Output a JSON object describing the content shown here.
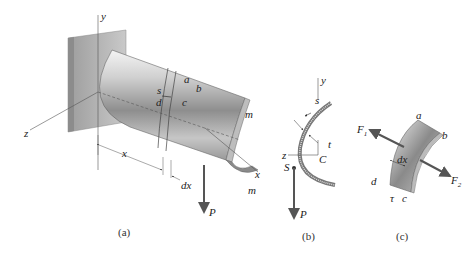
{
  "figure": {
    "panel_a": {
      "caption": "(a)",
      "labels": {
        "y": "y",
        "z": "z",
        "x_axis": "x",
        "x_dim": "x",
        "dx": "dx",
        "s": "s",
        "a": "a",
        "b": "b",
        "c": "c",
        "d": "d",
        "m_top": "m",
        "m_bottom": "m",
        "P": "P"
      }
    },
    "panel_b": {
      "caption": "(b)",
      "labels": {
        "y": "y",
        "z": "z",
        "s": "s",
        "t": "t",
        "C": "C",
        "S": "S",
        "P": "P"
      }
    },
    "panel_c": {
      "caption": "(c)",
      "labels": {
        "F1": "F",
        "F1_sub": "1",
        "F2": "F",
        "F2_sub": "2",
        "a": "a",
        "b": "b",
        "c": "c",
        "d": "d",
        "dx": "dx",
        "tau": "τ"
      }
    },
    "colors": {
      "metal_light": "#e6e6e6",
      "metal_mid": "#a8a8a8",
      "metal_dark": "#707070",
      "wall": "#b5b5b5",
      "arrow": "#555555"
    }
  }
}
